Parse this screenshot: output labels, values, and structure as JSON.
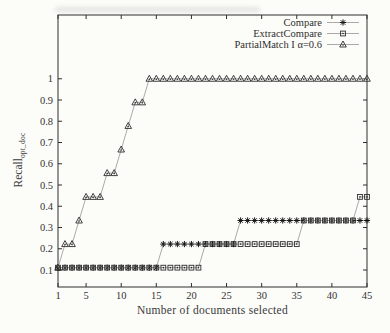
{
  "chart_data": {
    "type": "line",
    "title": "",
    "xlabel": "Number of documents selected",
    "ylabel": "Recall",
    "ylabel_subscript": "opt_doc",
    "xlim": [
      1,
      45
    ],
    "ylim": [
      0.02,
      1.3
    ],
    "xticks": [
      1,
      5,
      10,
      15,
      20,
      25,
      30,
      35,
      40,
      45
    ],
    "yticks": [
      0.1,
      0.2,
      0.3,
      0.4,
      0.5,
      0.6,
      0.7,
      0.8,
      0.9,
      1
    ],
    "grid": false,
    "legend_position": "top-right-inside",
    "x": [
      1,
      2,
      3,
      4,
      5,
      6,
      7,
      8,
      9,
      10,
      11,
      12,
      13,
      14,
      15,
      16,
      17,
      18,
      19,
      20,
      21,
      22,
      23,
      24,
      25,
      26,
      27,
      28,
      29,
      30,
      31,
      32,
      33,
      34,
      35,
      36,
      37,
      38,
      39,
      40,
      41,
      42,
      43,
      44,
      45
    ],
    "series": [
      {
        "name": "Compare",
        "marker": "asterisk",
        "marker_color": "#151515",
        "line_color": "#a0a0a0",
        "values": [
          0.111,
          0.111,
          0.111,
          0.111,
          0.111,
          0.111,
          0.111,
          0.111,
          0.111,
          0.111,
          0.111,
          0.111,
          0.111,
          0.111,
          0.111,
          0.222,
          0.222,
          0.222,
          0.222,
          0.222,
          0.222,
          0.222,
          0.222,
          0.222,
          0.222,
          0.222,
          0.333,
          0.333,
          0.333,
          0.333,
          0.333,
          0.333,
          0.333,
          0.333,
          0.333,
          0.333,
          0.333,
          0.333,
          0.333,
          0.333,
          0.333,
          0.333,
          0.333,
          0.333,
          0.333
        ]
      },
      {
        "name": "ExtractCompare",
        "marker": "square",
        "marker_color": "#2b2b2b",
        "line_color": "#a0a0a0",
        "values": [
          0.111,
          0.111,
          0.111,
          0.111,
          0.111,
          0.111,
          0.111,
          0.111,
          0.111,
          0.111,
          0.111,
          0.111,
          0.111,
          0.111,
          0.111,
          0.111,
          0.111,
          0.111,
          0.111,
          0.111,
          0.111,
          0.222,
          0.222,
          0.222,
          0.222,
          0.222,
          0.222,
          0.222,
          0.222,
          0.222,
          0.222,
          0.222,
          0.222,
          0.222,
          0.222,
          0.333,
          0.333,
          0.333,
          0.333,
          0.333,
          0.333,
          0.333,
          0.333,
          0.444,
          0.444
        ]
      },
      {
        "name": "PartialMatch I α=0.6",
        "marker": "triangle",
        "marker_color": "#2b2b2b",
        "line_color": "#a0a0a0",
        "values": [
          0.111,
          0.222,
          0.222,
          0.333,
          0.444,
          0.444,
          0.444,
          0.556,
          0.556,
          0.667,
          0.778,
          0.889,
          0.889,
          1,
          1,
          1,
          1,
          1,
          1,
          1,
          1,
          1,
          1,
          1,
          1,
          1,
          1,
          1,
          1,
          1,
          1,
          1,
          1,
          1,
          1,
          1,
          1,
          1,
          1,
          1,
          1,
          1,
          1,
          1,
          1
        ]
      }
    ],
    "colors": {
      "axis": "#2e2e2e",
      "text": "#333333",
      "background": "#fcfcf9"
    }
  }
}
